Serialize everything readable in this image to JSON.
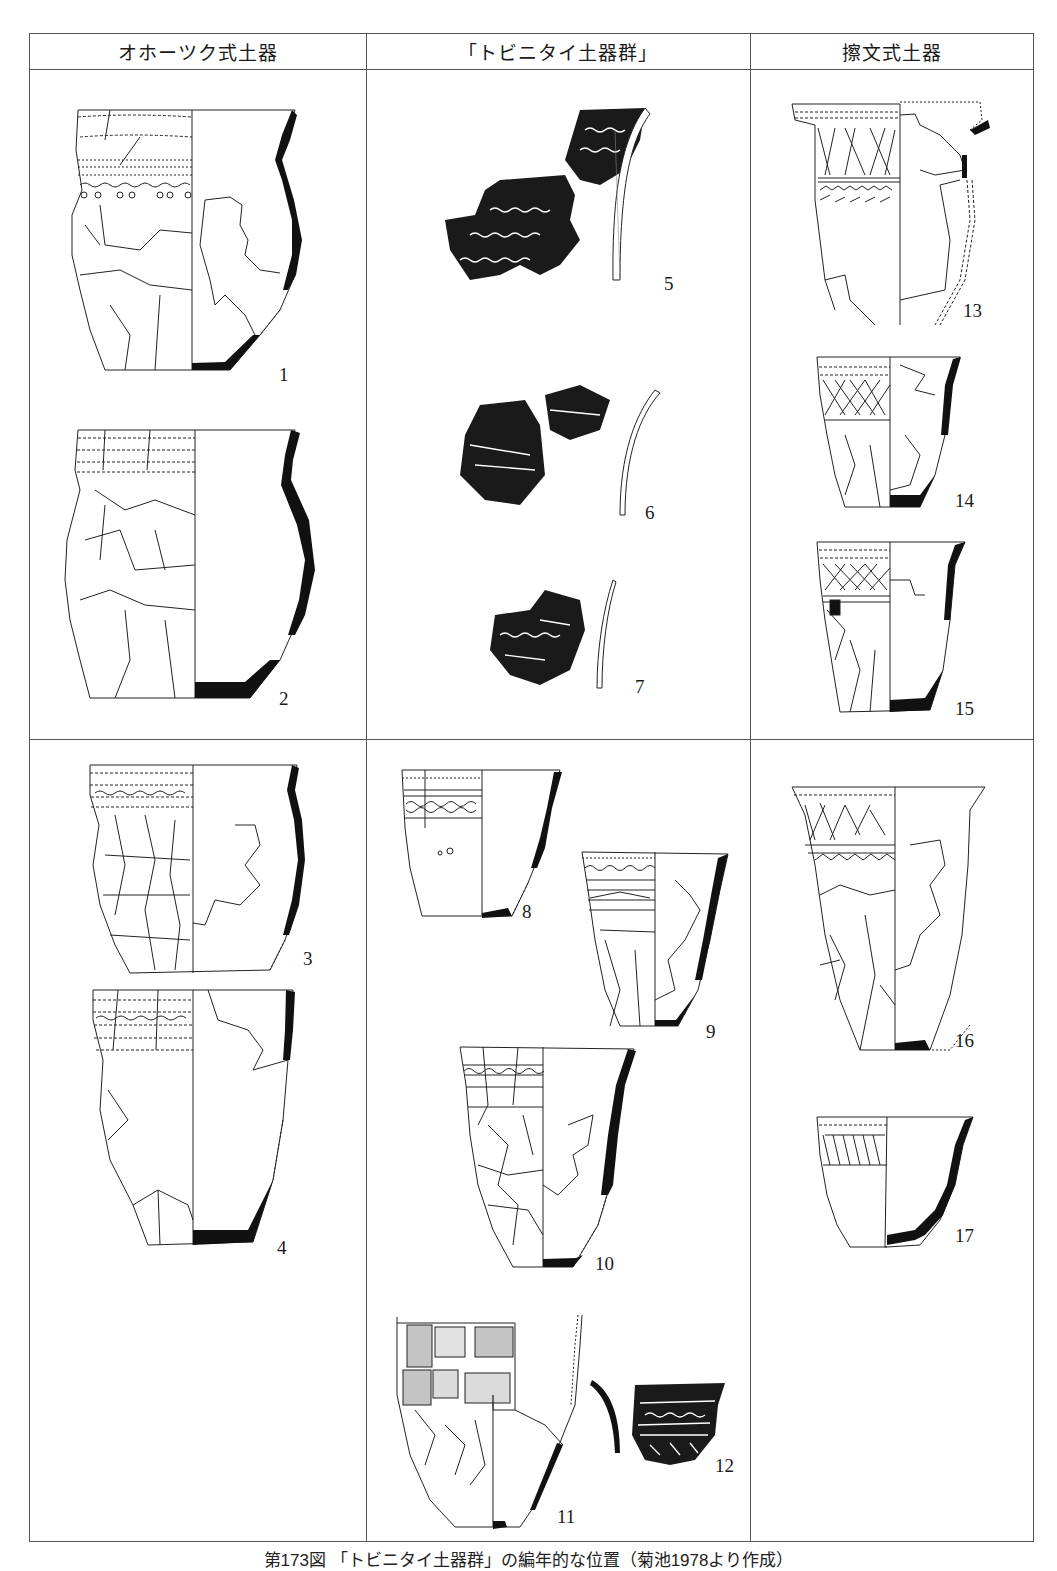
{
  "table": {
    "headers": [
      "オホーツク式土器",
      "「トビニタイ土器群」",
      "擦文式土器"
    ],
    "rows": 2
  },
  "figures": [
    {
      "id": "1",
      "column": 0,
      "row": 0,
      "type": "restored-vessel",
      "label": "1"
    },
    {
      "id": "2",
      "column": 0,
      "row": 0,
      "type": "restored-vessel",
      "label": "2"
    },
    {
      "id": "3",
      "column": 0,
      "row": 1,
      "type": "restored-vessel",
      "label": "3"
    },
    {
      "id": "4",
      "column": 0,
      "row": 1,
      "type": "restored-vessel",
      "label": "4"
    },
    {
      "id": "5",
      "column": 1,
      "row": 0,
      "type": "sherd-rubbing",
      "label": "5"
    },
    {
      "id": "6",
      "column": 1,
      "row": 0,
      "type": "sherd-rubbing",
      "label": "6"
    },
    {
      "id": "7",
      "column": 1,
      "row": 0,
      "type": "sherd-rubbing",
      "label": "7"
    },
    {
      "id": "8",
      "column": 1,
      "row": 1,
      "type": "restored-vessel",
      "label": "8"
    },
    {
      "id": "9",
      "column": 1,
      "row": 1,
      "type": "restored-vessel",
      "label": "9"
    },
    {
      "id": "10",
      "column": 1,
      "row": 1,
      "type": "restored-vessel",
      "label": "10"
    },
    {
      "id": "11",
      "column": 1,
      "row": 1,
      "type": "restored-vessel",
      "label": "11"
    },
    {
      "id": "12",
      "column": 1,
      "row": 1,
      "type": "sherd-rubbing",
      "label": "12"
    },
    {
      "id": "13",
      "column": 2,
      "row": 0,
      "type": "restored-vessel",
      "label": "13"
    },
    {
      "id": "14",
      "column": 2,
      "row": 0,
      "type": "restored-vessel",
      "label": "14"
    },
    {
      "id": "15",
      "column": 2,
      "row": 0,
      "type": "restored-vessel",
      "label": "15"
    },
    {
      "id": "16",
      "column": 2,
      "row": 1,
      "type": "restored-vessel",
      "label": "16"
    },
    {
      "id": "17",
      "column": 2,
      "row": 1,
      "type": "restored-vessel",
      "label": "17"
    }
  ],
  "caption": "第173図 「トビニタイ土器群」の編年的な位置（菊池1978より作成）",
  "colors": {
    "line": "#555555",
    "ink": "#111111",
    "paper": "#ffffff"
  }
}
